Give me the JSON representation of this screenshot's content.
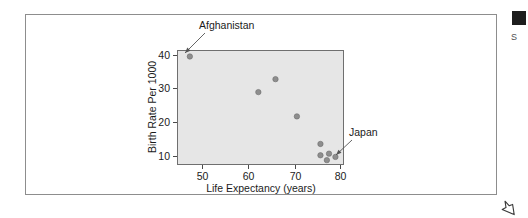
{
  "page": {
    "background_color": "#ffffff",
    "panel_border_color": "#8d8d8d"
  },
  "margin": {
    "marker_color": "#1d1d1d",
    "note_text": "S"
  },
  "cursor": {
    "icon": "mouse-pointer-icon"
  },
  "chart_data": {
    "type": "scatter",
    "title": "",
    "xlabel": "Life Expectancy (years)",
    "ylabel": "Birth Rate Per 1000",
    "xlim": [
      44,
      83
    ],
    "ylim": [
      7.5,
      43
    ],
    "xticks": [
      50,
      60,
      70,
      80
    ],
    "yticks": [
      10,
      20,
      30,
      40
    ],
    "grid": false,
    "legend": "none",
    "plot_background_color": "#e6e6e6",
    "point_color": "#8e8e8e",
    "points": [
      {
        "x": 47,
        "y": 41,
        "label": "Afghanistan"
      },
      {
        "x": 63,
        "y": 30,
        "label": ""
      },
      {
        "x": 67,
        "y": 34,
        "label": ""
      },
      {
        "x": 72,
        "y": 22.5,
        "label": ""
      },
      {
        "x": 77.5,
        "y": 14,
        "label": ""
      },
      {
        "x": 77.5,
        "y": 10.5,
        "label": ""
      },
      {
        "x": 79,
        "y": 9,
        "label": ""
      },
      {
        "x": 79.5,
        "y": 11,
        "label": ""
      },
      {
        "x": 81,
        "y": 10,
        "label": "Japan"
      }
    ],
    "annotations": [
      {
        "text": "Afghanistan",
        "text_x": 199,
        "text_y": 29,
        "anchor": "start",
        "line_from_x": 205,
        "line_from_y": 33,
        "line_to_x": 185,
        "line_to_y": 53
      },
      {
        "text": "Japan",
        "text_x": 349,
        "text_y": 136,
        "anchor": "start",
        "line_from_x": 352,
        "line_from_y": 140,
        "line_to_x": 336,
        "line_to_y": 155
      }
    ]
  },
  "axes_geometry": {
    "plot_left": 177,
    "plot_top": 50,
    "plot_right": 344,
    "plot_bottom": 165,
    "x_pixels": [
      202,
      248,
      295,
      340
    ],
    "y_pixels": [
      156,
      122,
      88,
      55
    ]
  }
}
